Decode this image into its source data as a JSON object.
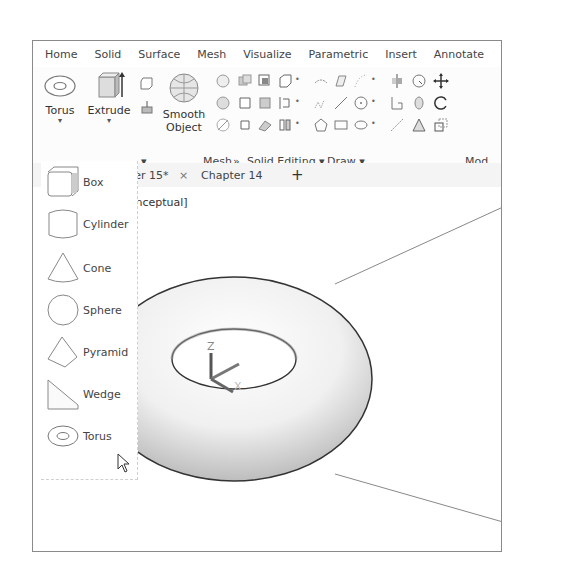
{
  "ribbon_tabs": [
    "Home",
    "Solid",
    "Surface",
    "Mesh",
    "Visualize",
    "Parametric",
    "Insert",
    "Annotate"
  ],
  "ribbon": {
    "torus_label": "Torus",
    "extrude_label": "Extrude",
    "smooth_object_label_1": "Smooth",
    "smooth_object_label_2": "Object",
    "groups": {
      "primitive_arrow": "▾",
      "mesh": "Mesh",
      "mesh_launcher": "»",
      "solid_editing": "Solid Editing ▾",
      "draw": "Draw ▾",
      "modify": "Mod"
    }
  },
  "document_tabs": {
    "active": "pter 15*",
    "active_close": "×",
    "other": "Chapter 14",
    "new_tab": "+"
  },
  "viewport": {
    "visual_style_label": "Conceptual]",
    "ucs_icon": {
      "z_label": "Z",
      "x_label": "X",
      "y_label": "Y"
    }
  },
  "dropdown": {
    "items": [
      {
        "label": "Box",
        "icon": "box-icon"
      },
      {
        "label": "Cylinder",
        "icon": "cylinder-icon"
      },
      {
        "label": "Cone",
        "icon": "cone-icon"
      },
      {
        "label": "Sphere",
        "icon": "sphere-icon"
      },
      {
        "label": "Pyramid",
        "icon": "pyramid-icon"
      },
      {
        "label": "Wedge",
        "icon": "wedge-icon"
      },
      {
        "label": "Torus",
        "icon": "torus-icon"
      }
    ]
  }
}
